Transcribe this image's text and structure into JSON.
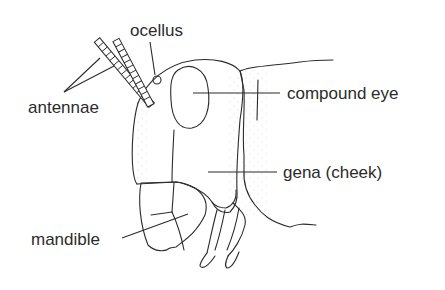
{
  "diagram": {
    "labels": [
      {
        "id": "ocellus",
        "text": "ocellus"
      },
      {
        "id": "antennae",
        "text": "antennae"
      },
      {
        "id": "compound_eye",
        "text": "compound eye"
      },
      {
        "id": "gena",
        "text": "gena (cheek)"
      },
      {
        "id": "mandible",
        "text": "mandible"
      }
    ]
  },
  "colors": {
    "line": "#2b2b2b",
    "stipple": "#7a7a7a",
    "background": "#ffffff"
  }
}
